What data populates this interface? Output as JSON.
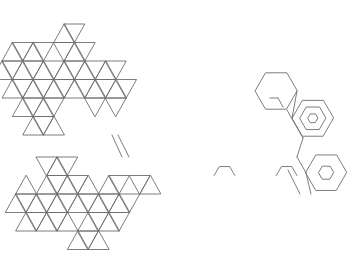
{
  "diagram": {
    "type": "triangular-lattice-tiling",
    "width": 352,
    "height": 273,
    "background": "#ffffff",
    "stroke_color": "#6e6e6e",
    "node_color": "#4a4a4a",
    "lattices": [
      {
        "name": "upper",
        "origin_x": 2,
        "origin_y": 24,
        "side": 20.7,
        "row_height": 18.5,
        "bands": [
          {
            "row": 0,
            "segments": [
              [
                6,
                8
              ]
            ]
          },
          {
            "row": 1,
            "segments": [
              [
                0,
                4
              ],
              [
                5,
                8
              ]
            ]
          },
          {
            "row": 2,
            "segments": [
              [
                0,
                12
              ]
            ]
          },
          {
            "row": 3,
            "segments": [
              [
                0,
                12
              ]
            ]
          },
          {
            "row": 4,
            "segments": [
              [
                2,
                6
              ],
              [
                9,
                10
              ],
              [
                11,
                12
              ]
            ]
          },
          {
            "row": 5,
            "segments": [
              [
                2,
                5
              ]
            ]
          }
        ]
      },
      {
        "name": "lower",
        "origin_x": 15.6,
        "origin_y": 157,
        "side": 20.7,
        "row_height": 18.5,
        "bands": [
          {
            "row": 0,
            "segments": [
              [
                3,
                6
              ]
            ]
          },
          {
            "row": 1,
            "segments": [
              [
                0,
                1
              ],
              [
                2,
                7
              ],
              [
                8,
                10
              ],
              [
                11,
                13
              ]
            ]
          },
          {
            "row": 2,
            "segments": [
              [
                0,
                12
              ]
            ]
          },
          {
            "row": 3,
            "segments": [
              [
                0,
                5
              ],
              [
                6,
                10
              ]
            ]
          },
          {
            "row": 4,
            "segments": [
              [
                6,
                9
              ]
            ]
          }
        ]
      }
    ],
    "hexagons": [
      {
        "name": "outline-hexagon-right-upper",
        "cx": 276,
        "cy": 91,
        "r": 21
      },
      {
        "name": "concentric-hexagon-outer-1",
        "cx": 312.7,
        "cy": 118.3,
        "r": 20.7
      },
      {
        "name": "concentric-hexagon-middle-1",
        "cx": 312.7,
        "cy": 118.3,
        "r": 13
      },
      {
        "name": "concentric-hexagon-inner-1",
        "cx": 312.7,
        "cy": 118.3,
        "r": 5
      },
      {
        "name": "concentric-hexagon-outer-2",
        "cx": 326,
        "cy": 172.7,
        "r": 20.5
      },
      {
        "name": "concentric-hexagon-inner-2",
        "cx": 326,
        "cy": 172.7,
        "r": 7.5
      },
      {
        "name": "bump-hexagon-lower-1",
        "cx": 224.5,
        "cy": 175.5,
        "r": 10.35,
        "half": "top"
      },
      {
        "name": "bump-hexagon-lower-2",
        "cx": 286.6,
        "cy": 175.5,
        "r": 10.35,
        "half": "top"
      }
    ],
    "connectors": [
      {
        "name": "diagonal-connector-left-a",
        "x1": 112,
        "y1": 135,
        "x2": 122,
        "y2": 157
      },
      {
        "name": "diagonal-connector-left-b",
        "x1": 118,
        "y1": 135,
        "x2": 129,
        "y2": 157
      },
      {
        "name": "diagonal-connector-right-a",
        "x1": 287,
        "y1": 110,
        "x2": 303,
        "y2": 138
      },
      {
        "name": "diagonal-connector-right-b",
        "x1": 303,
        "y1": 138,
        "x2": 297,
        "y2": 157
      },
      {
        "name": "diagonal-connector-right-c",
        "x1": 297,
        "y1": 157,
        "x2": 306,
        "y2": 172.7
      },
      {
        "name": "diagonal-connector-right-d",
        "x1": 306,
        "y1": 172.7,
        "x2": 311,
        "y2": 194
      },
      {
        "name": "diagonal-connector-right-e",
        "x1": 288,
        "y1": 170,
        "x2": 300,
        "y2": 194
      },
      {
        "name": "notch-upper-a",
        "x1": 270,
        "y1": 98,
        "x2": 278,
        "y2": 98
      },
      {
        "name": "notch-upper-b",
        "x1": 278,
        "y1": 98,
        "x2": 283,
        "y2": 107
      },
      {
        "name": "line-hex-link",
        "x1": 297,
        "y1": 91,
        "x2": 292,
        "y2": 118.3
      }
    ]
  }
}
